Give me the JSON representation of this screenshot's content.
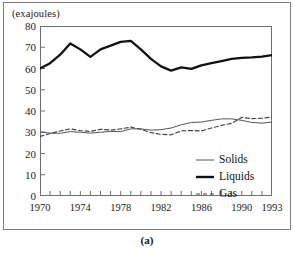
{
  "figure": {
    "caption": "(a)",
    "unit_label": "(exajoules)"
  },
  "legend": {
    "position": "inside-bottom-right",
    "items": [
      {
        "label": "Solids",
        "style": "thin-solid-line",
        "color": "#555555"
      },
      {
        "label": "Liquids",
        "style": "thick-solid-line",
        "color": "#111111"
      },
      {
        "label": "Gas",
        "style": "dashed-line",
        "color": "#444444"
      }
    ]
  },
  "axes": {
    "y_ticks": [
      "0",
      "10",
      "20",
      "30",
      "40",
      "50",
      "60",
      "70",
      "80"
    ],
    "x_ticks_labeled": [
      "1970",
      "1974",
      "1978",
      "1982",
      "1986",
      "1990",
      "1993"
    ]
  },
  "chart_data": {
    "type": "line",
    "title": "",
    "subtitle": "",
    "xlabel": "",
    "ylabel": "(exajoules)",
    "xlim": [
      1970,
      1993
    ],
    "ylim": [
      0,
      80
    ],
    "ytick_step": 10,
    "xtick_step": 1,
    "xtick_label_step": 4,
    "grid": false,
    "legend_position": "inside-bottom-right",
    "x": [
      1970,
      1971,
      1972,
      1973,
      1974,
      1975,
      1976,
      1977,
      1978,
      1979,
      1980,
      1981,
      1982,
      1983,
      1984,
      1985,
      1986,
      1987,
      1988,
      1989,
      1990,
      1991,
      1992,
      1993
    ],
    "series": [
      {
        "name": "Liquids",
        "style": "thick-solid-line",
        "color": "#111111",
        "values": [
          60.0,
          62.5,
          66.5,
          71.8,
          69.0,
          65.5,
          69.0,
          70.8,
          72.5,
          73.0,
          69.0,
          64.5,
          61.0,
          59.0,
          60.5,
          59.8,
          61.5,
          62.5,
          63.5,
          64.5,
          65.0,
          65.2,
          65.6,
          66.3
        ]
      },
      {
        "name": "Solids",
        "style": "thin-solid-line",
        "color": "#555555",
        "values": [
          30.2,
          29.6,
          29.5,
          30.3,
          30.0,
          29.6,
          30.0,
          30.4,
          30.3,
          31.6,
          31.6,
          31.0,
          31.2,
          32.0,
          33.5,
          34.6,
          34.8,
          35.6,
          36.3,
          36.3,
          35.6,
          34.6,
          34.3,
          34.8
        ]
      },
      {
        "name": "Gas",
        "style": "dashed-line",
        "color": "#444444",
        "values": [
          28.0,
          29.4,
          30.6,
          31.6,
          30.8,
          30.4,
          31.4,
          31.0,
          31.6,
          32.4,
          31.4,
          29.8,
          29.0,
          28.8,
          30.6,
          30.8,
          30.6,
          32.0,
          33.2,
          34.2,
          37.0,
          36.4,
          36.6,
          37.2
        ]
      }
    ]
  }
}
